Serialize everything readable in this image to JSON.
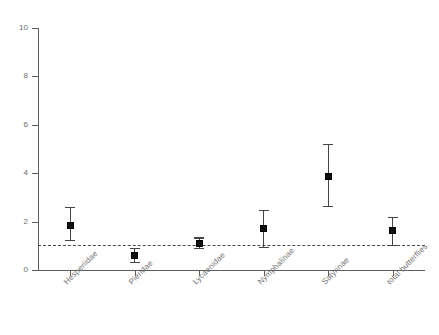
{
  "chart_data": {
    "type": "scatter",
    "title": "",
    "subtitle": "",
    "xlabel": "",
    "ylabel": "",
    "ylim": [
      0,
      10
    ],
    "yticks": [
      0,
      2,
      4,
      6,
      8,
      10
    ],
    "ytick_labels": [
      "0",
      "2",
      "4",
      "6",
      "8",
      "10"
    ],
    "grid": false,
    "legend": null,
    "reference_line": {
      "value": 1,
      "style": "dashed",
      "orientation": "horizontal",
      "color": "#4a4a4a"
    },
    "categories": [
      "Hesperiidae",
      "Pieridae",
      "Lycaenidae",
      "Nymphalinae",
      "Satyrinae",
      "total butterflies"
    ],
    "series": [
      {
        "name": "mean with error bars",
        "marker": "square",
        "color": "#111111",
        "values": [
          1.85,
          0.6,
          1.1,
          1.7,
          3.85,
          1.65
        ],
        "lower": [
          1.25,
          0.35,
          0.9,
          0.95,
          2.65,
          1.05
        ],
        "upper": [
          2.6,
          0.9,
          1.35,
          2.5,
          5.2,
          2.2
        ]
      }
    ],
    "points": [
      {
        "category": "Hesperiidae",
        "value": 1.85,
        "lower": 1.25,
        "upper": 2.6
      },
      {
        "category": "Pieridae",
        "value": 0.6,
        "lower": 0.35,
        "upper": 0.9
      },
      {
        "category": "Lycaenidae",
        "value": 1.1,
        "lower": 0.9,
        "upper": 1.35
      },
      {
        "category": "Nymphalinae",
        "value": 1.7,
        "lower": 0.95,
        "upper": 2.5
      },
      {
        "category": "Satyrinae",
        "value": 3.85,
        "lower": 2.65,
        "upper": 5.2
      },
      {
        "category": "total butterflies",
        "value": 1.65,
        "lower": 1.05,
        "upper": 2.2
      }
    ]
  },
  "axes": {
    "y_tick_labels": [
      "10",
      "8",
      "6",
      "4",
      "2",
      "0"
    ]
  },
  "colors": {
    "axis": "#5d5d5d",
    "marker": "#111111",
    "whisker": "#444444",
    "reference": "#4a4a4a",
    "tick_text": "#6a6a6a",
    "category_text": "#737373",
    "background": "#ffffff"
  }
}
